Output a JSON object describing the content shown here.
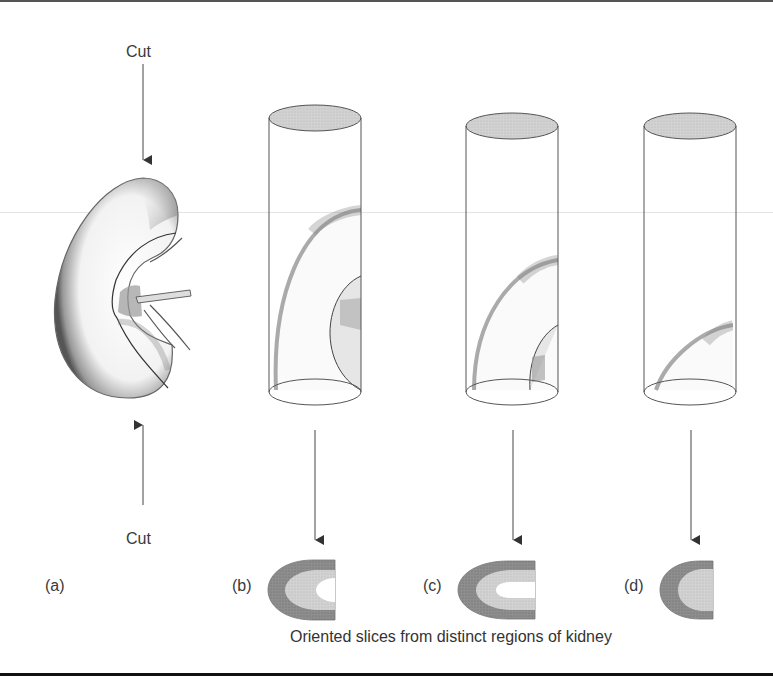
{
  "figure": {
    "kidney": {
      "label": "(a)",
      "cut_top_label": "Cut",
      "cut_bottom_label": "Cut"
    },
    "cylinders": [
      {
        "id": "b",
        "label": "(b)"
      },
      {
        "id": "c",
        "label": "(c)"
      },
      {
        "id": "d",
        "label": "(d)"
      }
    ],
    "caption": "Oriented slices from distinct regions of kidney",
    "colors": {
      "cortex_dark": "#8a8a8a",
      "medulla_light": "#c8c8c8",
      "cap_fill": "#bdbdbd",
      "line": "#555555",
      "rule": "#111111"
    }
  }
}
